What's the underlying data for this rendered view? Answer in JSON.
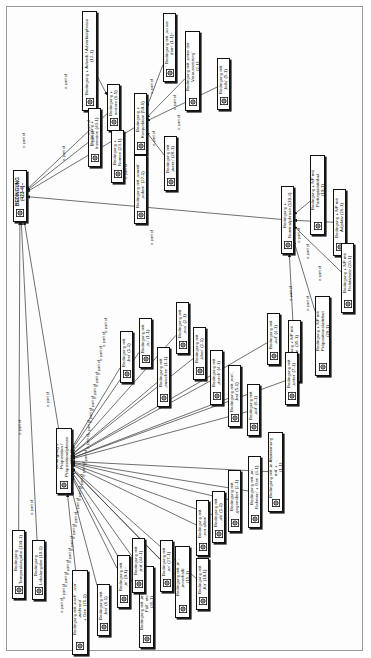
{
  "figure": {
    "orientation": "rotated-90",
    "edge_label": "is part of",
    "colors": {
      "node_border": "#111111",
      "node_fill": "#ffffff",
      "edge": "#333333",
      "sheet_border": "#9a9a9a",
      "page": "#ffffff"
    }
  },
  "nodes": [
    {
      "id": "n0",
      "label": "BEDINGUNG (423-4)~",
      "x": 13,
      "y": 170,
      "w": 14,
      "h": 52,
      "kind": "root"
    },
    {
      "id": "n1",
      "label": "Bedingung + andere (6-5)",
      "x": 107,
      "y": 84,
      "w": 13,
      "h": 47,
      "kind": "node"
    },
    {
      "id": "n2",
      "label": "Bedingung + Adverb / Adverbialphrase\n(12-1)",
      "x": 82,
      "y": 11,
      "w": 15,
      "h": 100,
      "kind": "node"
    },
    {
      "id": "n3",
      "label": "Bedingung + Inversion (40-1)",
      "x": 88,
      "y": 108,
      "w": 13,
      "h": 59,
      "kind": "node"
    },
    {
      "id": "n4",
      "label": "Bedingung + Nomen (23-1)",
      "x": 111,
      "y": 130,
      "w": 13,
      "h": 53,
      "kind": "node"
    },
    {
      "id": "n5",
      "label": "Bedingung + Konjunktion (59-6)",
      "x": 134,
      "y": 93,
      "w": 13,
      "h": 62,
      "kind": "node"
    },
    {
      "id": "n6",
      "label": "Bedingung mit ‚so sei dem‘ (1-1)~",
      "x": 163,
      "y": 13,
      "w": 13,
      "h": 69,
      "kind": "node"
    },
    {
      "id": "n7",
      "label": "Bedingung mit ‚unter der Voraussetzung‘\n(2-1)",
      "x": 185,
      "y": 31,
      "w": 15,
      "h": 80,
      "kind": "node"
    },
    {
      "id": "n8",
      "label": "Bedingung mit ‚falls‘ (5-1)",
      "x": 217,
      "y": 58,
      "w": 13,
      "h": 52,
      "kind": "node"
    },
    {
      "id": "n9",
      "label": "Bedingung mit ‚soweit‘, ‚sofern‘ (27-1)",
      "x": 134,
      "y": 155,
      "w": 13,
      "h": 69,
      "kind": "node"
    },
    {
      "id": "n10",
      "label": "Bedingung mit ‚wenn‘ (28-1)",
      "x": 164,
      "y": 136,
      "w": 13,
      "h": 55,
      "kind": "node"
    },
    {
      "id": "n11",
      "label": "Bedingung + Nominalphrase (119-4)",
      "x": 281,
      "y": 186,
      "w": 13,
      "h": 68,
      "kind": "node"
    },
    {
      "id": "n12",
      "label": "Bedingung + NP mit Partizipialattribut\n(19-1)",
      "x": 310,
      "y": 155,
      "w": 15,
      "h": 80,
      "kind": "node"
    },
    {
      "id": "n13",
      "label": "Bedingung + NP mit Adjektiv (26-1)",
      "x": 333,
      "y": 189,
      "w": 13,
      "h": 67,
      "kind": "node"
    },
    {
      "id": "n14",
      "label": "Bedingung + NP mit Relativsatz (20-1)",
      "x": 341,
      "y": 243,
      "w": 13,
      "h": 70,
      "kind": "node"
    },
    {
      "id": "n15",
      "label": "Bedingung + NP mit Präpositionalattribut\n(28-1)",
      "x": 315,
      "y": 296,
      "w": 15,
      "h": 80,
      "kind": "node"
    },
    {
      "id": "n16",
      "label": "Bedingung + NP mit Gen. (35-1)",
      "x": 288,
      "y": 320,
      "w": 13,
      "h": 62,
      "kind": "node"
    },
    {
      "id": "n17",
      "label": "Bedingung + Präposition /\nPräpositionalphrase (370-1)",
      "x": 56,
      "y": 428,
      "w": 16,
      "h": 66,
      "kind": "hub"
    },
    {
      "id": "n18",
      "label": "Bedingung mit ‚bei‘ (1-1)",
      "x": 120,
      "y": 331,
      "w": 13,
      "h": 52,
      "kind": "node"
    },
    {
      "id": "n19",
      "label": "Bedingung mit ‚zu‘ (1-1)",
      "x": 139,
      "y": 318,
      "w": 13,
      "h": 50,
      "kind": "node"
    },
    {
      "id": "n20",
      "label": "Bedingung mit ‚zwischen‘ (1-1)",
      "x": 157,
      "y": 347,
      "w": 13,
      "h": 60,
      "kind": "node"
    },
    {
      "id": "n21",
      "label": "Bedingung mit ‚aus‘ (2-1)",
      "x": 176,
      "y": 302,
      "w": 13,
      "h": 52,
      "kind": "node"
    },
    {
      "id": "n22",
      "label": "Bedingung mit ‚über‘ (2-1)",
      "x": 193,
      "y": 327,
      "w": 13,
      "h": 53,
      "kind": "node"
    },
    {
      "id": "n23",
      "label": "Bedingung mit ‚durch‘ (4-1)",
      "x": 210,
      "y": 350,
      "w": 13,
      "h": 55,
      "kind": "node"
    },
    {
      "id": "n24",
      "label": "Bedingung mit ‚von‘, ‚bei‘ (5-1)",
      "x": 228,
      "y": 365,
      "w": 13,
      "h": 62,
      "kind": "node"
    },
    {
      "id": "n25",
      "label": "Bedingung mit ‚auf‘ (6-1)",
      "x": 247,
      "y": 384,
      "w": 13,
      "h": 52,
      "kind": "node"
    },
    {
      "id": "n26",
      "label": "Bedingung mit ‚auf‘ (4-1)",
      "x": 267,
      "y": 313,
      "w": 13,
      "h": 52,
      "kind": "node"
    },
    {
      "id": "n27",
      "label": "Bedingung mit ‚unter‘ (7-1)",
      "x": 285,
      "y": 352,
      "w": 13,
      "h": 53,
      "kind": "node"
    },
    {
      "id": "n28",
      "label": "Bedingung mit ‚in Abstimmung mit‘ + …\n(1-1)",
      "x": 268,
      "y": 432,
      "w": 15,
      "h": 80,
      "kind": "node"
    },
    {
      "id": "n29",
      "label": "Bedingung mit ‚im Rahmen‘ + Gen. (4-1)",
      "x": 248,
      "y": 456,
      "w": 13,
      "h": 72,
      "kind": "node"
    },
    {
      "id": "n30",
      "label": "Bedingung mit ‚gegenüber‘ (2-1)",
      "x": 228,
      "y": 470,
      "w": 13,
      "h": 62,
      "kind": "node"
    },
    {
      "id": "n31",
      "label": "Bedingung mit ‚ab‘ (1-1)",
      "x": 212,
      "y": 491,
      "w": 13,
      "h": 52,
      "kind": "node"
    },
    {
      "id": "n32",
      "label": "Bedingung mit ‚vor allem‘ …",
      "x": 196,
      "y": 500,
      "w": 13,
      "h": 56,
      "kind": "node"
    },
    {
      "id": "n33",
      "label": "Bedingung mit ‚in‘, ‚innerhalb‘\n(15-1)",
      "x": 175,
      "y": 546,
      "w": 15,
      "h": 72,
      "kind": "node"
    },
    {
      "id": "n34",
      "label": "Bedingung mit ‚für‘ (19-1)",
      "x": 196,
      "y": 558,
      "w": 13,
      "h": 52,
      "kind": "node"
    },
    {
      "id": "n35",
      "label": "Bedingung mit ‚an‘ (27-1)",
      "x": 160,
      "y": 540,
      "w": 13,
      "h": 52,
      "kind": "node"
    },
    {
      "id": "n36",
      "label": "Bedingung mit ‚im Falle‘, ‚im Fall‘, etc.\n(45-1)",
      "x": 139,
      "y": 566,
      "w": 15,
      "h": 82,
      "kind": "node"
    },
    {
      "id": "n37",
      "label": "Bedingung mit ‚mit‘ (44-1)",
      "x": 132,
      "y": 538,
      "w": 13,
      "h": 55,
      "kind": "node"
    },
    {
      "id": "n38",
      "label": "Bedingung mit ‚in‘ (9-1)~",
      "x": 117,
      "y": 555,
      "w": 13,
      "h": 53,
      "kind": "node"
    },
    {
      "id": "n39",
      "label": "Bedingung mit ‚bei‘ (6-1)",
      "x": 97,
      "y": 584,
      "w": 13,
      "h": 52,
      "kind": "node"
    },
    {
      "id": "n40",
      "label": "Bedingung mit ‚nach‘, ‚vor‘, ‚während‘\n+ Gen. (75-1)",
      "x": 72,
      "y": 570,
      "w": 16,
      "h": 85,
      "kind": "node"
    },
    {
      "id": "n41",
      "label": "Bedingung Temporalangabe (139-1)",
      "x": 12,
      "y": 530,
      "w": 13,
      "h": 69,
      "kind": "node"
    },
    {
      "id": "n42",
      "label": "Bedingung Lokalangabe (10-1)",
      "x": 32,
      "y": 540,
      "w": 13,
      "h": 60,
      "kind": "node"
    }
  ],
  "edges": [
    {
      "from": "n1",
      "to": "n0",
      "label": "is part of",
      "lx": 22,
      "ly": 133
    },
    {
      "from": "n2",
      "to": "n1",
      "label": "is part of",
      "lx": 64,
      "ly": 74
    },
    {
      "from": "n3",
      "to": "n0",
      "label": "is part of",
      "lx": 62,
      "ly": 146
    },
    {
      "from": "n4",
      "to": "n1",
      "label": "is part of",
      "lx": 87,
      "ly": 120
    },
    {
      "from": "n5",
      "to": "n0",
      "label": "is part of",
      "lx": 91,
      "ly": 131
    },
    {
      "from": "n6",
      "to": "n5",
      "label": "is part of",
      "lx": 150,
      "ly": 79
    },
    {
      "from": "n7",
      "to": "n5",
      "label": "is part of",
      "lx": 173,
      "ly": 95
    },
    {
      "from": "n8",
      "to": "n5",
      "label": "is part of",
      "lx": 177,
      "ly": 115
    },
    {
      "from": "n9",
      "to": "n5",
      "label": "is part of",
      "lx": 124,
      "ly": 164
    },
    {
      "from": "n10",
      "to": "n5",
      "label": "is part of",
      "lx": 152,
      "ly": 131
    },
    {
      "from": "n11",
      "to": "n0",
      "label": "is part of",
      "lx": 150,
      "ly": 230
    },
    {
      "from": "n12",
      "to": "n11",
      "label": "is part of",
      "lx": 297,
      "ly": 228
    },
    {
      "from": "n13",
      "to": "n11",
      "label": "is part of",
      "lx": 306,
      "ly": 244
    },
    {
      "from": "n14",
      "to": "n11",
      "label": "is part of",
      "lx": 318,
      "ly": 266
    },
    {
      "from": "n15",
      "to": "n11",
      "label": "is part of",
      "lx": 306,
      "ly": 296
    },
    {
      "from": "n16",
      "to": "n11",
      "label": "is part of",
      "lx": 289,
      "ly": 286
    },
    {
      "from": "n17",
      "to": "n0",
      "label": "is part of",
      "lx": 46,
      "ly": 392
    },
    {
      "from": "n18",
      "to": "n17",
      "label": "is part of",
      "lx": 99,
      "ly": 346
    },
    {
      "from": "n19",
      "to": "n17",
      "label": "is part of",
      "lx": 97,
      "ly": 360
    },
    {
      "from": "n20",
      "to": "n17",
      "label": "is part of",
      "lx": 95,
      "ly": 372
    },
    {
      "from": "n21",
      "to": "n17",
      "label": "is part of",
      "lx": 102,
      "ly": 332
    },
    {
      "from": "n22",
      "to": "n17",
      "label": "is part of",
      "lx": 93,
      "ly": 384
    },
    {
      "from": "n23",
      "to": "n17",
      "label": "is part of",
      "lx": 91,
      "ly": 396
    },
    {
      "from": "n24",
      "to": "n17",
      "label": "is part of",
      "lx": 89,
      "ly": 408
    },
    {
      "from": "n25",
      "to": "n17",
      "label": "is part of",
      "lx": 87,
      "ly": 420
    },
    {
      "from": "n26",
      "to": "n17",
      "label": "is part of",
      "lx": 104,
      "ly": 318
    },
    {
      "from": "n27",
      "to": "n17",
      "label": "is part of",
      "lx": 86,
      "ly": 434
    },
    {
      "from": "n28",
      "to": "n17",
      "label": "is part of",
      "lx": 84,
      "ly": 450
    },
    {
      "from": "n29",
      "to": "n17",
      "label": "is part of",
      "lx": 82,
      "ly": 462
    },
    {
      "from": "n30",
      "to": "n17",
      "label": "is part of",
      "lx": 80,
      "ly": 474
    },
    {
      "from": "n31",
      "to": "n17",
      "label": "is part of",
      "lx": 78,
      "ly": 486
    },
    {
      "from": "n32",
      "to": "n17",
      "label": "is part of",
      "lx": 76,
      "ly": 498
    },
    {
      "from": "n33",
      "to": "n17",
      "label": "is part of",
      "lx": 74,
      "ly": 512
    },
    {
      "from": "n34",
      "to": "n17",
      "label": "is part of",
      "lx": 72,
      "ly": 524
    },
    {
      "from": "n35",
      "to": "n17",
      "label": "is part of",
      "lx": 70,
      "ly": 536
    },
    {
      "from": "n36",
      "to": "n17",
      "label": "is part of",
      "lx": 68,
      "ly": 548
    },
    {
      "from": "n37",
      "to": "n17",
      "label": "is part of",
      "lx": 66,
      "ly": 560
    },
    {
      "from": "n38",
      "to": "n17",
      "label": "is part of",
      "lx": 64,
      "ly": 572
    },
    {
      "from": "n39",
      "to": "n17",
      "label": "is part of",
      "lx": 62,
      "ly": 584
    },
    {
      "from": "n40",
      "to": "n17",
      "label": "is part of",
      "lx": 60,
      "ly": 598
    },
    {
      "from": "n41",
      "to": "n0",
      "label": "is part of",
      "lx": 18,
      "ly": 420
    },
    {
      "from": "n42",
      "to": "n0",
      "label": "is part of",
      "lx": 30,
      "ly": 500
    }
  ]
}
